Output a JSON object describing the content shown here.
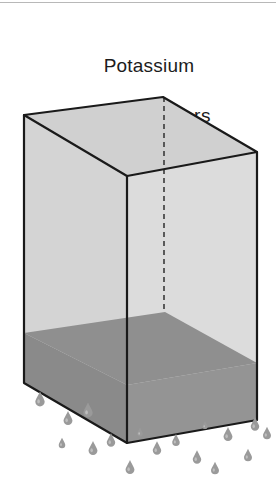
{
  "figure": {
    "width": 276,
    "height": 501,
    "background": "#ffffff",
    "kind": "isometric-box-decay-illustration"
  },
  "caption": {
    "title": "Potassium",
    "subtitle": "11 million  years",
    "color": "#1c1c1c"
  },
  "colors": {
    "outline": "#1a1a1a",
    "top_face": "#d0d0d0",
    "left_face": "#d4d4d4",
    "right_face": "#dcdcdc",
    "fill_top": "#8f8f8f",
    "fill_left": "#8a8a8a",
    "fill_right": "#949494",
    "dashed_edge": "#3a3a3a",
    "droplet": "#9a9a9a",
    "droplet_highlight": "#c9c9c9",
    "top_rule": "#b8b8b8"
  },
  "box": {
    "label": "container",
    "vertices": {
      "top_left": [
        24,
        115
      ],
      "top_back": [
        163,
        97
      ],
      "top_right": [
        257,
        152
      ],
      "top_front": [
        127,
        176
      ],
      "bottom_left": [
        24,
        383
      ],
      "bottom_front": [
        127,
        443
      ],
      "bottom_right": [
        257,
        420
      ],
      "bottom_back_hidden": [
        163,
        365
      ]
    },
    "hidden_edge": {
      "name": "back-vertical-edge",
      "from": [
        164,
        97
      ],
      "to": [
        164,
        312
      ],
      "style": "dashed"
    }
  },
  "fill_layer": {
    "label": "remaining-potassium",
    "surface": {
      "left": [
        24,
        333
      ],
      "back": [
        165,
        312
      ],
      "right": [
        257,
        363
      ],
      "front": [
        127,
        385
      ]
    },
    "bottom": {
      "left": [
        24,
        383
      ],
      "front": [
        127,
        443
      ],
      "right": [
        257,
        420
      ]
    }
  },
  "droplets": {
    "label": "decay-droplets",
    "count": 17,
    "items": [
      {
        "x": 40,
        "y": 399,
        "s": 1.0
      },
      {
        "x": 68,
        "y": 418,
        "s": 0.95
      },
      {
        "x": 88,
        "y": 410,
        "s": 1.0
      },
      {
        "x": 62,
        "y": 443,
        "s": 0.7
      },
      {
        "x": 93,
        "y": 448,
        "s": 0.95
      },
      {
        "x": 111,
        "y": 440,
        "s": 0.9
      },
      {
        "x": 130,
        "y": 467,
        "s": 0.95
      },
      {
        "x": 157,
        "y": 448,
        "s": 0.9
      },
      {
        "x": 176,
        "y": 440,
        "s": 0.8
      },
      {
        "x": 197,
        "y": 457,
        "s": 0.9
      },
      {
        "x": 215,
        "y": 468,
        "s": 0.85
      },
      {
        "x": 228,
        "y": 434,
        "s": 0.95
      },
      {
        "x": 248,
        "y": 455,
        "s": 0.85
      },
      {
        "x": 255,
        "y": 424,
        "s": 0.9
      },
      {
        "x": 267,
        "y": 433,
        "s": 0.85
      },
      {
        "x": 140,
        "y": 432,
        "s": 0.6
      },
      {
        "x": 205,
        "y": 425,
        "s": 0.55
      }
    ]
  }
}
